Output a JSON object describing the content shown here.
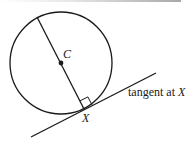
{
  "diagram": {
    "type": "geometry",
    "labels": {
      "center": "C",
      "point": "X",
      "tangent_prefix": "tangent at ",
      "tangent_point": "X"
    },
    "colors": {
      "stroke": "#1a1a1a",
      "background": "#ffffff"
    }
  }
}
